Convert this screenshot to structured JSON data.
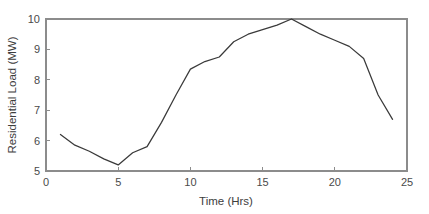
{
  "chart_data": {
    "type": "line",
    "title": "",
    "xlabel": "Time (Hrs)",
    "ylabel": "Residential Load (MW)",
    "xlim": [
      0,
      25
    ],
    "ylim": [
      5,
      10
    ],
    "xticks": [
      0,
      5,
      10,
      15,
      20,
      25
    ],
    "yticks": [
      5,
      6,
      7,
      8,
      9,
      10
    ],
    "xtick_labels": [
      "0",
      "5",
      "10",
      "15",
      "20",
      "25"
    ],
    "ytick_labels": [
      "5",
      "6",
      "7",
      "8",
      "9",
      "10"
    ],
    "grid": false,
    "legend": null,
    "series": [
      {
        "name": "Residential Load",
        "color": "#3a3a3a",
        "x": [
          1,
          2,
          3,
          4,
          5,
          6,
          7,
          8,
          9,
          10,
          11,
          12,
          13,
          14,
          15,
          16,
          17,
          18,
          19,
          20,
          21,
          22,
          23,
          24
        ],
        "values": [
          6.2,
          5.85,
          5.65,
          5.4,
          5.2,
          5.6,
          5.8,
          6.6,
          7.5,
          8.35,
          8.6,
          8.75,
          9.25,
          9.5,
          9.65,
          9.8,
          10.0,
          9.75,
          9.5,
          9.3,
          9.1,
          8.7,
          7.5,
          6.7
        ]
      }
    ],
    "annotations": []
  },
  "axes": {
    "x_axis_title": "Time (Hrs)",
    "y_axis_title": "Residential Load (MW)"
  },
  "style": {
    "axis_color": "#8c8c8c",
    "line_color": "#3a3a3a",
    "text_color": "#3d3d3d",
    "background": "#ffffff"
  }
}
